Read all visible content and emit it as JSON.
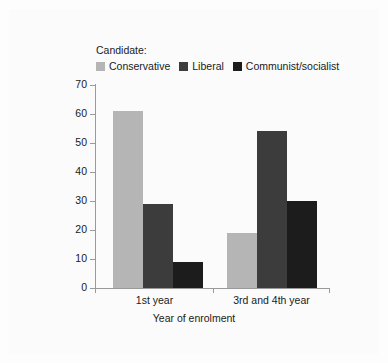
{
  "chart_data": {
    "type": "bar",
    "title": "",
    "xlabel": "Year of enrolment",
    "ylabel": "Percentage vote",
    "categories": [
      "1st year",
      "3rd and 4th year"
    ],
    "series": [
      {
        "name": "Conservative",
        "values": [
          61,
          19
        ],
        "color": "#b5b5b5"
      },
      {
        "name": "Liberal",
        "values": [
          29,
          54
        ],
        "color": "#3c3c3c"
      },
      {
        "name": "Communist/socialist",
        "values": [
          9,
          30
        ],
        "color": "#1c1c1c"
      }
    ],
    "ylim": [
      0,
      70
    ],
    "yticks": [
      0,
      10,
      20,
      30,
      40,
      50,
      60,
      70
    ],
    "ytick_labels": [
      "0",
      "10",
      "20",
      "30",
      "40",
      "50",
      "60",
      "70"
    ],
    "grid": false,
    "legend_title": "Candidate:",
    "legend_position": "top-left"
  },
  "legend": {
    "title": "Candidate:",
    "items": [
      {
        "label": "Conservative",
        "color": "#b5b5b5"
      },
      {
        "label": "Liberal",
        "color": "#3c3c3c"
      },
      {
        "label": "Communist/socialist",
        "color": "#1c1c1c"
      }
    ]
  },
  "axes": {
    "y_label": "Percentage vote",
    "x_label": "Year of enrolment",
    "y_ticks": [
      "70",
      "60",
      "50",
      "40",
      "30",
      "20",
      "10",
      "0"
    ],
    "x_groups": [
      "1st year",
      "3rd and 4th year"
    ]
  },
  "colors": {
    "background": "#fdfdfd",
    "axis": "#9a9a9a",
    "text": "#1a1a1a"
  }
}
